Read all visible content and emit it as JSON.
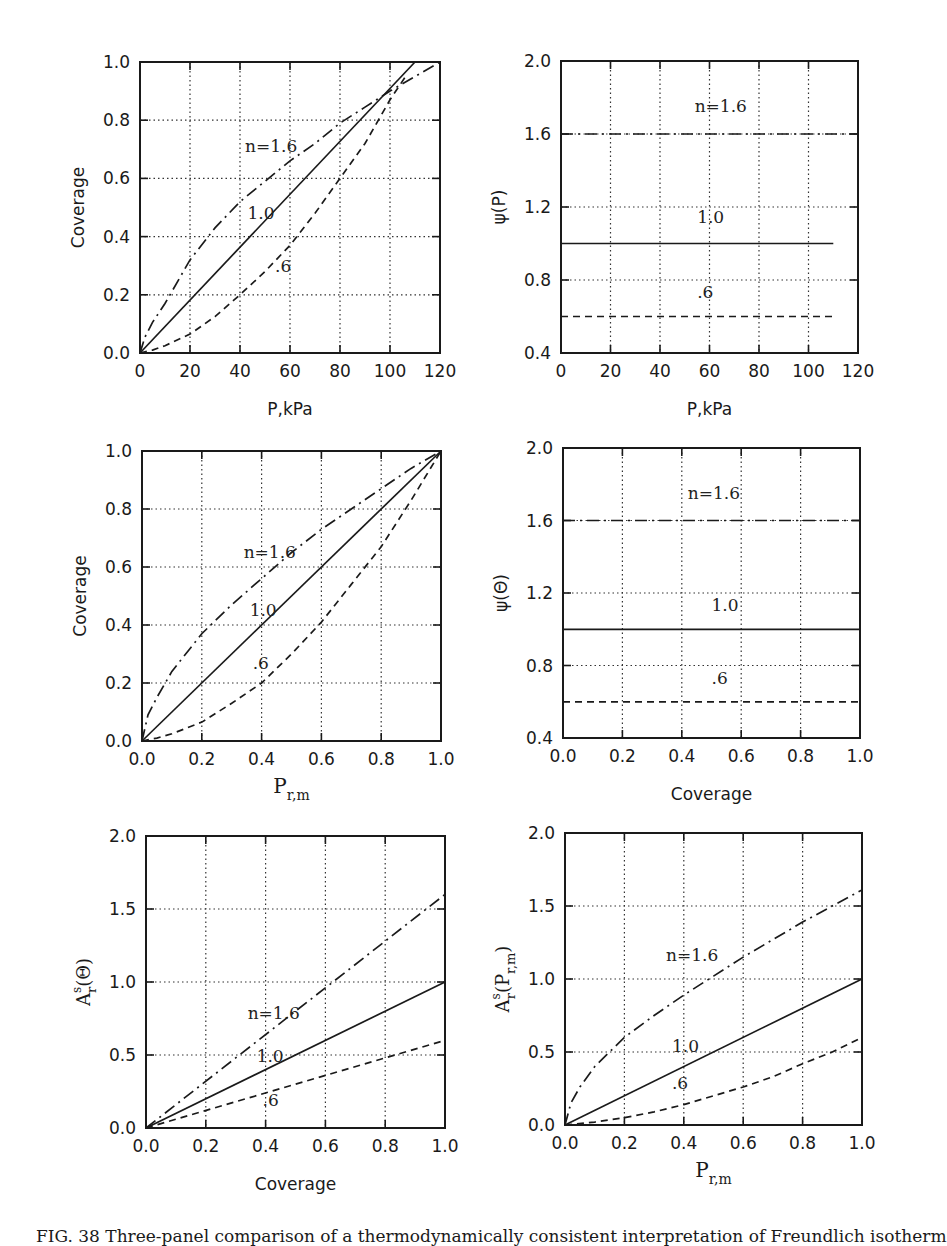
{
  "caption": "FIG. 38  Three-panel comparison of a thermodynamically consistent interpretation of Freundlich isotherm",
  "curve_labels": {
    "n16": "n=1.6",
    "n10": "1.0",
    "n06": ".6"
  },
  "chart_data": [
    {
      "id": "p1",
      "type": "line",
      "xlabel": "P,kPa",
      "ylabel": "Coverage",
      "xlim": [
        0,
        120
      ],
      "ylim": [
        0,
        1.0
      ],
      "xticks": [
        0,
        20,
        40,
        60,
        80,
        100,
        120
      ],
      "yticks": [
        0.0,
        0.2,
        0.4,
        0.6,
        0.8,
        1.0
      ],
      "xtick_labels": [
        "0",
        "20",
        "40",
        "60",
        "80",
        "100",
        "120"
      ],
      "ytick_labels": [
        "0.0",
        "0.2",
        "0.4",
        "0.6",
        "0.8",
        "1.0"
      ],
      "grid": true,
      "series": [
        {
          "name": "n=1.6",
          "style": "dashdot",
          "x": [
            0,
            2,
            5,
            10,
            20,
            30,
            40,
            50,
            60,
            70,
            80,
            90,
            100,
            110,
            120
          ],
          "y": [
            0,
            0.055,
            0.105,
            0.17,
            0.32,
            0.43,
            0.52,
            0.59,
            0.66,
            0.72,
            0.79,
            0.845,
            0.9,
            0.95,
            1.0
          ]
        },
        {
          "name": "1.0",
          "style": "solid",
          "x": [
            0,
            110
          ],
          "y": [
            0,
            1.0
          ]
        },
        {
          "name": ".6",
          "style": "dashed",
          "x": [
            0,
            5,
            10,
            20,
            30,
            40,
            50,
            60,
            70,
            80,
            90,
            100,
            107
          ],
          "y": [
            0,
            0.01,
            0.025,
            0.065,
            0.125,
            0.2,
            0.28,
            0.37,
            0.48,
            0.6,
            0.72,
            0.87,
            0.96
          ]
        }
      ],
      "annotations": [
        {
          "text": "n=1.6",
          "x": 42,
          "y": 0.69
        },
        {
          "text": "1.0",
          "x": 43,
          "y": 0.46
        },
        {
          "text": ".6",
          "x": 54,
          "y": 0.28
        }
      ]
    },
    {
      "id": "p2",
      "type": "line",
      "xlabel": "P,kPa",
      "ylabel": "ψ(P)",
      "xlim": [
        0,
        120
      ],
      "ylim": [
        0.4,
        2.0
      ],
      "xticks": [
        0,
        20,
        40,
        60,
        80,
        100,
        120
      ],
      "yticks": [
        0.4,
        0.8,
        1.2,
        1.6,
        2.0
      ],
      "xtick_labels": [
        "0",
        "20",
        "40",
        "60",
        "80",
        "100",
        "120"
      ],
      "ytick_labels": [
        "0.4",
        "0.8",
        "1.2",
        "1.6",
        "2.0"
      ],
      "grid": true,
      "series": [
        {
          "name": "n=1.6",
          "style": "dashdot",
          "x": [
            0,
            120
          ],
          "y": [
            1.6,
            1.6
          ]
        },
        {
          "name": "1.0",
          "style": "solid",
          "x": [
            0,
            110
          ],
          "y": [
            1.0,
            1.0
          ]
        },
        {
          "name": ".6",
          "style": "dashed",
          "x": [
            0,
            110
          ],
          "y": [
            0.6,
            0.6
          ]
        }
      ],
      "annotations": [
        {
          "text": "n=1.6",
          "x": 54,
          "y": 1.72
        },
        {
          "text": "1.0",
          "x": 55,
          "y": 1.11
        },
        {
          "text": ".6",
          "x": 55,
          "y": 0.7
        }
      ]
    },
    {
      "id": "p3",
      "type": "line",
      "xlabel": "P_r,m",
      "ylabel": "Coverage",
      "xlim": [
        0,
        1.0
      ],
      "ylim": [
        0,
        1.0
      ],
      "xticks": [
        0,
        0.2,
        0.4,
        0.6,
        0.8,
        1.0
      ],
      "yticks": [
        0,
        0.2,
        0.4,
        0.6,
        0.8,
        1.0
      ],
      "xtick_labels": [
        "0.0",
        "0.2",
        "0.4",
        "0.6",
        "0.8",
        "1.0"
      ],
      "ytick_labels": [
        "0.0",
        "0.2",
        "0.4",
        "0.6",
        "0.8",
        "1.0"
      ],
      "grid": true,
      "series": [
        {
          "name": "n=1.6",
          "style": "dashdot",
          "x": [
            0,
            0.02,
            0.05,
            0.1,
            0.2,
            0.3,
            0.4,
            0.5,
            0.6,
            0.7,
            0.8,
            0.9,
            1.0
          ],
          "y": [
            0,
            0.09,
            0.15,
            0.24,
            0.37,
            0.47,
            0.56,
            0.65,
            0.73,
            0.8,
            0.87,
            0.94,
            1.0
          ]
        },
        {
          "name": "1.0",
          "style": "solid",
          "x": [
            0,
            1.0
          ],
          "y": [
            0,
            1.0
          ]
        },
        {
          "name": ".6",
          "style": "dashed",
          "x": [
            0,
            0.05,
            0.1,
            0.2,
            0.3,
            0.4,
            0.5,
            0.6,
            0.7,
            0.8,
            0.9,
            1.0
          ],
          "y": [
            0,
            0.01,
            0.025,
            0.065,
            0.13,
            0.2,
            0.3,
            0.41,
            0.54,
            0.67,
            0.83,
            1.0
          ]
        }
      ],
      "annotations": [
        {
          "text": "n=1.6",
          "x": 0.34,
          "y": 0.63
        },
        {
          "text": "1.0",
          "x": 0.36,
          "y": 0.43
        },
        {
          "text": ".6",
          "x": 0.37,
          "y": 0.25
        }
      ]
    },
    {
      "id": "p4",
      "type": "line",
      "xlabel": "Coverage",
      "ylabel": "ψ(Θ)",
      "xlim": [
        0,
        1.0
      ],
      "ylim": [
        0.4,
        2.0
      ],
      "xticks": [
        0,
        0.2,
        0.4,
        0.6,
        0.8,
        1.0
      ],
      "yticks": [
        0.4,
        0.8,
        1.2,
        1.6,
        2.0
      ],
      "xtick_labels": [
        "0.0",
        "0.2",
        "0.4",
        "0.6",
        "0.8",
        "1.0"
      ],
      "ytick_labels": [
        "0.4",
        "0.8",
        "1.2",
        "1.6",
        "2.0"
      ],
      "grid": true,
      "series": [
        {
          "name": "n=1.6",
          "style": "dashdot",
          "x": [
            0,
            1.0
          ],
          "y": [
            1.6,
            1.6
          ]
        },
        {
          "name": "1.0",
          "style": "solid",
          "x": [
            0,
            1.0
          ],
          "y": [
            1.0,
            1.0
          ]
        },
        {
          "name": ".6",
          "style": "dashed",
          "x": [
            0,
            1.0
          ],
          "y": [
            0.6,
            0.6
          ]
        }
      ],
      "annotations": [
        {
          "text": "n=1.6",
          "x": 0.42,
          "y": 1.72
        },
        {
          "text": "1.0",
          "x": 0.5,
          "y": 1.1
        },
        {
          "text": ".6",
          "x": 0.5,
          "y": 0.7
        }
      ]
    },
    {
      "id": "p5",
      "type": "line",
      "xlabel": "Coverage",
      "ylabel": "A^s_r(Θ)",
      "xlim": [
        0,
        1.0
      ],
      "ylim": [
        0,
        2.0
      ],
      "xticks": [
        0,
        0.2,
        0.4,
        0.6,
        0.8,
        1.0
      ],
      "yticks": [
        0,
        0.5,
        1.0,
        1.5,
        2.0
      ],
      "xtick_labels": [
        "0.0",
        "0.2",
        "0.4",
        "0.6",
        "0.8",
        "1.0"
      ],
      "ytick_labels": [
        "0.0",
        "0.5",
        "1.0",
        "1.5",
        "2.0"
      ],
      "grid": true,
      "series": [
        {
          "name": "n=1.6",
          "style": "dashdot",
          "x": [
            0,
            1.0
          ],
          "y": [
            0,
            1.6
          ]
        },
        {
          "name": "1.0",
          "style": "solid",
          "x": [
            0,
            1.0
          ],
          "y": [
            0,
            1.0
          ]
        },
        {
          "name": ".6",
          "style": "dashed",
          "x": [
            0,
            1.0
          ],
          "y": [
            0,
            0.6
          ]
        }
      ],
      "annotations": [
        {
          "text": "n=1.6",
          "x": 0.34,
          "y": 0.75
        },
        {
          "text": "1.0",
          "x": 0.37,
          "y": 0.45
        },
        {
          "text": ".6",
          "x": 0.39,
          "y": 0.15
        }
      ]
    },
    {
      "id": "p6",
      "type": "line",
      "xlabel": "P_r,m",
      "ylabel": "A^s_r(P_r,m)",
      "xlim": [
        0,
        1.0
      ],
      "ylim": [
        0,
        2.0
      ],
      "xticks": [
        0,
        0.2,
        0.4,
        0.6,
        0.8,
        1.0
      ],
      "yticks": [
        0,
        0.5,
        1.0,
        1.5,
        2.0
      ],
      "xtick_labels": [
        "0.0",
        "0.2",
        "0.4",
        "0.6",
        "0.8",
        "1.0"
      ],
      "ytick_labels": [
        "0.0",
        "0.5",
        "1.0",
        "1.5",
        "2.0"
      ],
      "grid": true,
      "series": [
        {
          "name": "n=1.6",
          "style": "dashdot",
          "x": [
            0,
            0.02,
            0.05,
            0.1,
            0.15,
            0.2,
            0.3,
            0.4,
            0.5,
            0.6,
            0.7,
            0.8,
            0.9,
            1.0
          ],
          "y": [
            0,
            0.15,
            0.26,
            0.4,
            0.5,
            0.6,
            0.75,
            0.89,
            1.02,
            1.15,
            1.27,
            1.39,
            1.5,
            1.61
          ]
        },
        {
          "name": "1.0",
          "style": "solid",
          "x": [
            0,
            1.0
          ],
          "y": [
            0,
            1.0
          ]
        },
        {
          "name": ".6",
          "style": "dashed",
          "x": [
            0,
            0.1,
            0.2,
            0.3,
            0.4,
            0.5,
            0.6,
            0.7,
            0.8,
            0.9,
            1.0
          ],
          "y": [
            0,
            0.02,
            0.05,
            0.09,
            0.14,
            0.2,
            0.26,
            0.33,
            0.42,
            0.5,
            0.6
          ]
        }
      ],
      "annotations": [
        {
          "text": "n=1.6",
          "x": 0.34,
          "y": 1.12
        },
        {
          "text": "1.0",
          "x": 0.36,
          "y": 0.5
        },
        {
          "text": ".6",
          "x": 0.36,
          "y": 0.25
        }
      ]
    }
  ]
}
